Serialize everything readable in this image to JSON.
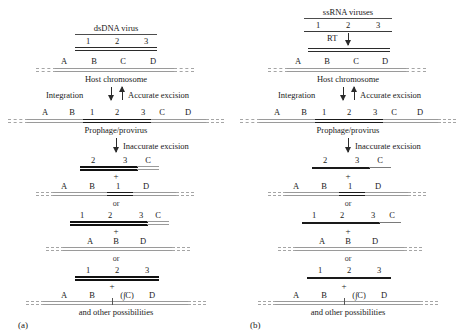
{
  "figure": {
    "caption_a": "(a)",
    "caption_b": "(b)",
    "footer_text": "and other possibilities"
  },
  "labels": {
    "viral_segments": [
      "1",
      "2",
      "3"
    ],
    "host_segments": [
      "A",
      "B",
      "C",
      "D"
    ],
    "plus": "+",
    "or": "or",
    "deletion_notation": "(∫C)"
  },
  "panel_a": {
    "virus_title": "dsDNA virus",
    "virus_segments": [
      "1",
      "2",
      "3"
    ],
    "host_label": "Host chromosome",
    "host_segments": [
      "A",
      "B",
      "C",
      "D"
    ],
    "integration_label": "Integration",
    "accurate_excision_label": "Accurate excision",
    "prophage_label": "Prophage/provirus",
    "prophage_segments": [
      "A",
      "B",
      "1",
      "2",
      "3",
      "C",
      "D"
    ],
    "inaccurate_excision_label": "Inaccurate excision",
    "outcome_1": {
      "viral_product_segments": [
        "2",
        "3",
        "C"
      ],
      "host_product_segments": [
        "A",
        "B",
        "1",
        "D"
      ]
    },
    "outcome_2": {
      "viral_product_segments": [
        "1",
        "2",
        "3",
        "C"
      ],
      "host_product_segments": [
        "A",
        "B",
        "D"
      ]
    },
    "outcome_3": {
      "viral_product_segments": [
        "1",
        "2",
        "3"
      ],
      "host_product_segments": [
        "A",
        "B",
        "(∫C)",
        "D"
      ]
    },
    "footer": "and other possibilities",
    "caption": "(a)"
  },
  "panel_b": {
    "virus_title": "ssRNA viruses",
    "virus_segments": [
      "1",
      "2",
      "3"
    ],
    "rt_label": "RT",
    "host_label": "Host chromosome",
    "host_segments": [
      "A",
      "B",
      "C",
      "D"
    ],
    "integration_label": "Integration",
    "accurate_excision_label": "Accurate excision",
    "prophage_label": "Prophage/provirus",
    "prophage_segments": [
      "A",
      "B",
      "1",
      "2",
      "3",
      "C",
      "D"
    ],
    "inaccurate_excision_label": "Inaccurate excision",
    "outcome_1": {
      "viral_product_segments": [
        "2",
        "3",
        "C"
      ],
      "host_product_segments": [
        "A",
        "B",
        "1",
        "D"
      ]
    },
    "outcome_2": {
      "viral_product_segments": [
        "1",
        "2",
        "3",
        "C"
      ],
      "host_product_segments": [
        "A",
        "B",
        "D"
      ]
    },
    "outcome_3": {
      "viral_product_segments": [
        "1",
        "2",
        "3"
      ],
      "host_product_segments": [
        "A",
        "B",
        "(∫C)",
        "D"
      ]
    },
    "footer": "and other possibilities",
    "caption": "(b)"
  },
  "colors": {
    "ink": "#1a1a1a",
    "line_dark": "#2b2b2b",
    "line_grey": "#9a9a9a",
    "background": "#ffffff"
  }
}
